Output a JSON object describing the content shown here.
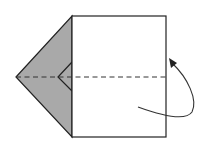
{
  "diagram": {
    "type": "origami-fold-step",
    "colors": {
      "paper_front": "#ffffff",
      "paper_back": "#a9a9a9",
      "outline": "#222222",
      "fold_line": "#333333",
      "arrow": "#333333"
    },
    "square": {
      "x": 72,
      "y": 16,
      "width": 94,
      "height": 121
    },
    "flap": {
      "tip": [
        16,
        77
      ],
      "top": [
        72,
        16
      ],
      "bottom": [
        72,
        137
      ]
    },
    "inner_fold": {
      "tip": [
        58,
        77
      ],
      "top": [
        72,
        62
      ],
      "bottom": [
        72,
        91
      ]
    },
    "fold_line": {
      "type": "valley",
      "from": [
        16,
        77
      ],
      "to": [
        166,
        77
      ]
    },
    "arrow": {
      "direction": "fold-behind-upward",
      "start": [
        138,
        107
      ],
      "end": [
        170,
        60
      ]
    }
  }
}
